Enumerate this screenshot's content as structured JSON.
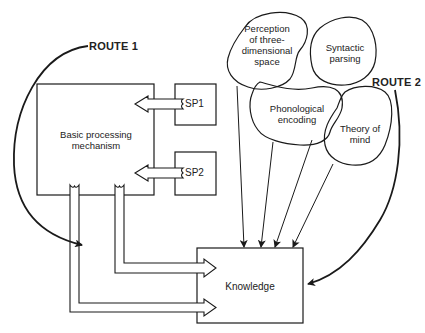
{
  "diagram": {
    "routes": [
      {
        "id": "route1",
        "label": "ROUTE 1"
      },
      {
        "id": "route2",
        "label": "ROUTE 2"
      }
    ],
    "boxes": {
      "basic": "Basic processing mechanism",
      "basic_line1": "Basic processing",
      "basic_line2": "mechanism",
      "sp1": "SP1",
      "sp2": "SP2",
      "knowledge": "Knowledge"
    },
    "modules": [
      {
        "id": "perception",
        "lines": [
          "Perception",
          "of three-",
          "dimensional",
          "space"
        ]
      },
      {
        "id": "syntactic",
        "lines": [
          "Syntactic",
          "parsing"
        ]
      },
      {
        "id": "phonological",
        "lines": [
          "Phonological",
          "encoding"
        ]
      },
      {
        "id": "theory",
        "lines": [
          "Theory of",
          "mind"
        ]
      }
    ],
    "colors": {
      "stroke": "#1a1a1a",
      "background": "#ffffff"
    }
  }
}
